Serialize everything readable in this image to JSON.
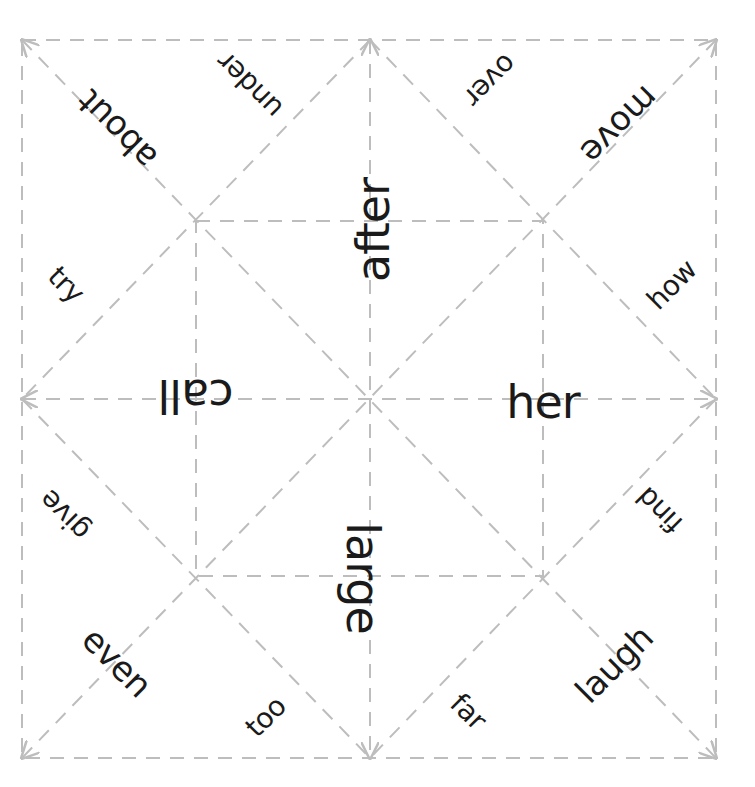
{
  "colors": {
    "background": "#ffffff",
    "text": "#1a1a1a",
    "fold_lines": "#bdbdbd"
  },
  "geometry": {
    "outer_square": {
      "x1": 22,
      "y1": 40,
      "x2": 716,
      "y2": 758
    },
    "inner_square": {
      "x1": 196,
      "y1": 221,
      "x2": 543,
      "y2": 576
    },
    "center": {
      "x": 370,
      "y": 399
    },
    "line_style": "dashed"
  },
  "center_words": {
    "top": {
      "text": "after",
      "x": 373,
      "y": 230,
      "rotation": -90
    },
    "left": {
      "text": "call",
      "x": 196,
      "y": 396,
      "rotation": 180
    },
    "right": {
      "text": "her",
      "x": 543,
      "y": 402,
      "rotation": 0
    },
    "bottom": {
      "text": "large",
      "x": 363,
      "y": 578,
      "rotation": 90
    }
  },
  "flap_words": [
    {
      "text": "about",
      "x": 117,
      "y": 130,
      "rotation": -135,
      "size": "mid"
    },
    {
      "text": "under",
      "x": 250,
      "y": 85,
      "rotation": -135,
      "size": "small"
    },
    {
      "text": "over",
      "x": 490,
      "y": 80,
      "rotation": 135,
      "size": "small"
    },
    {
      "text": "move",
      "x": 620,
      "y": 125,
      "rotation": 135,
      "size": "mid"
    },
    {
      "text": "try",
      "x": 66,
      "y": 285,
      "rotation": 45,
      "size": "small"
    },
    {
      "text": "how",
      "x": 672,
      "y": 285,
      "rotation": -45,
      "size": "small"
    },
    {
      "text": "give",
      "x": 65,
      "y": 515,
      "rotation": -135,
      "size": "small"
    },
    {
      "text": "find",
      "x": 660,
      "y": 510,
      "rotation": -135,
      "size": "small"
    },
    {
      "text": "even",
      "x": 117,
      "y": 662,
      "rotation": 45,
      "size": "mid"
    },
    {
      "text": "too",
      "x": 266,
      "y": 717,
      "rotation": -45,
      "size": "small"
    },
    {
      "text": "far",
      "x": 468,
      "y": 712,
      "rotation": 45,
      "size": "small"
    },
    {
      "text": "laugh",
      "x": 614,
      "y": 664,
      "rotation": -45,
      "size": "mid"
    }
  ]
}
